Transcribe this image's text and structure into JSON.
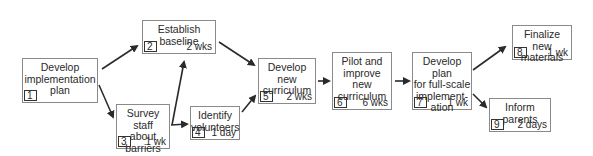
{
  "diagram": {
    "type": "activity-network",
    "nodes": [
      {
        "id": "1",
        "label": "Develop\nimplementation\nplan",
        "duration": "",
        "box": [
          22,
          58,
          76,
          45
        ]
      },
      {
        "id": "2",
        "label": "Establish\nbaseline",
        "duration": "2 wks",
        "box": [
          142,
          20,
          74,
          34
        ]
      },
      {
        "id": "3",
        "label": "Survey staff\nabout\nbarriers",
        "duration": "1 wk",
        "box": [
          116,
          104,
          54,
          45
        ]
      },
      {
        "id": "4",
        "label": "Identify\nvolunteers",
        "duration": "1 day",
        "box": [
          190,
          106,
          50,
          34
        ]
      },
      {
        "id": "5",
        "label": "Develop\nnew\ncurriculum",
        "duration": "2 wks",
        "box": [
          258,
          58,
          58,
          46
        ]
      },
      {
        "id": "6",
        "label": "Pilot  and\nimprove\nnew\ncurriculum",
        "duration": "6 wks",
        "box": [
          332,
          52,
          60,
          58
        ]
      },
      {
        "id": "7",
        "label": "Develop plan\nfor full-scale\nimplement-\nation",
        "duration": "1 wk",
        "box": [
          412,
          52,
          60,
          58
        ]
      },
      {
        "id": "8",
        "label": "Finalize new\nmaterials",
        "duration": "1 wk",
        "box": [
          512,
          25,
          60,
          35
        ]
      },
      {
        "id": "9",
        "label": "Inform\nparents",
        "duration": "2 days",
        "box": [
          489,
          98,
          62,
          34
        ]
      }
    ],
    "edges": [
      {
        "from": "1",
        "to": "2",
        "line": [
          102,
          69,
          137,
          46
        ]
      },
      {
        "from": "1",
        "to": "3",
        "line": [
          99,
          85,
          113,
          117
        ]
      },
      {
        "from": "3",
        "to": "2",
        "line": [
          172,
          125,
          184,
          62
        ]
      },
      {
        "from": "3",
        "to": "4",
        "line": [
          171,
          125,
          187,
          124
        ]
      },
      {
        "from": "2",
        "to": "5",
        "line": [
          219,
          42,
          254,
          65
        ]
      },
      {
        "from": "4",
        "to": "5",
        "line": [
          242,
          112,
          255,
          96
        ]
      },
      {
        "from": "5",
        "to": "6",
        "line": [
          318,
          81,
          329,
          81
        ]
      },
      {
        "from": "6",
        "to": "7",
        "line": [
          395,
          81,
          409,
          81
        ]
      },
      {
        "from": "7",
        "to": "8",
        "line": [
          473,
          70,
          505,
          47
        ]
      },
      {
        "from": "7",
        "to": "9",
        "line": [
          473,
          94,
          486,
          107
        ]
      }
    ]
  }
}
